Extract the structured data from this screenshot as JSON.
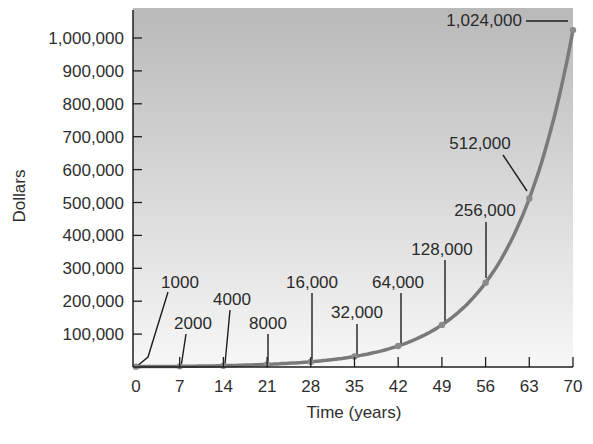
{
  "chart_data": {
    "type": "line",
    "title": "",
    "xlabel": "Time (years)",
    "ylabel": "Dollars",
    "x": [
      0,
      7,
      14,
      21,
      28,
      35,
      42,
      49,
      56,
      63,
      70
    ],
    "series": [
      {
        "name": "Doubling every 7 years",
        "values": [
          1000,
          2000,
          4000,
          8000,
          16000,
          32000,
          64000,
          128000,
          256000,
          512000,
          1024000
        ]
      }
    ],
    "point_labels": [
      "1000",
      "2000",
      "4000",
      "8000",
      "16,000",
      "32,000",
      "64,000",
      "128,000",
      "256,000",
      "512,000",
      "1,024,000"
    ],
    "x_ticks": [
      "0",
      "7",
      "14",
      "21",
      "28",
      "35",
      "42",
      "49",
      "56",
      "63",
      "70"
    ],
    "y_ticks": [
      "100,000",
      "200,000",
      "300,000",
      "400,000",
      "500,000",
      "600,000",
      "700,000",
      "800,000",
      "900,000",
      "1,000,000"
    ],
    "xlim": [
      0,
      70
    ],
    "ylim": [
      0,
      1050000
    ],
    "grid": false,
    "legend": "none",
    "colors": {
      "curve": "#7a7a7a",
      "plot_bg_top": "#b9b9b9",
      "plot_bg_bottom": "#f7f7f7",
      "axis": "#1e1e1e"
    }
  }
}
